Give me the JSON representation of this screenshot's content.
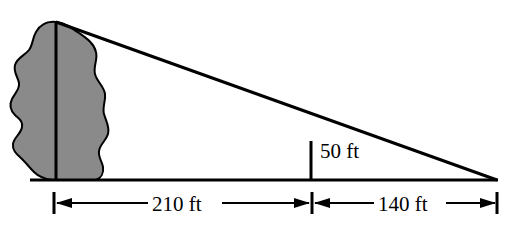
{
  "diagram": {
    "background_color": "#ffffff",
    "line_color": "#000000",
    "tree_fill_color": "#8a8a8a",
    "tree_outline_color": "#000000",
    "labels": {
      "tree_height_label": "",
      "pole_height": "50 ft",
      "near_distance": "210 ft",
      "far_distance": "140 ft"
    },
    "geometry": {
      "ground_line_y": 180,
      "apex_x": 56,
      "apex_y": 22,
      "tip_x": 497,
      "tip_y": 180,
      "pole_x": 311,
      "pole_top_y": 141,
      "dim_line_y": 203,
      "tick_left_x": 54,
      "tick_mid_x": 311,
      "tick_right_x": 497
    },
    "measurements": {
      "pole_height_ft": 50,
      "near_distance_ft": 210,
      "far_distance_ft": 140
    }
  }
}
